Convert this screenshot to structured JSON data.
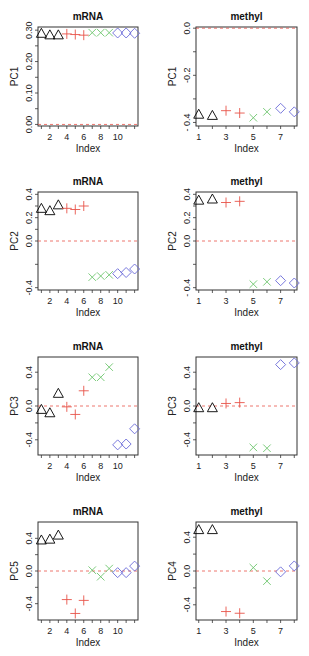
{
  "colors": {
    "group1": "#000000",
    "group2": "#e8534a",
    "group3": "#6cc56c",
    "group4": "#6a6ad8",
    "zero_line": "#e8534a",
    "axis": "#333333"
  },
  "chart_data": [
    {
      "type": "scatter",
      "title": "mRNA",
      "xlabel": "Index",
      "ylabel": "PC1",
      "x": [
        1,
        2,
        3,
        4,
        5,
        6,
        7,
        8,
        9,
        10,
        11,
        12
      ],
      "values": [
        0.29,
        0.285,
        0.285,
        0.288,
        0.286,
        0.284,
        0.292,
        0.292,
        0.292,
        0.291,
        0.291,
        0.29
      ],
      "groups": [
        1,
        1,
        1,
        2,
        2,
        2,
        3,
        3,
        3,
        4,
        4,
        4
      ],
      "xticks": [
        "2",
        "4",
        "6",
        "8",
        "10"
      ],
      "yticks": [
        "0.00",
        "0.10",
        "0.20",
        "0.30"
      ],
      "ylim": [
        -0.005,
        0.31
      ],
      "xlim": [
        0.6,
        12.4
      ],
      "hline": 0
    },
    {
      "type": "scatter",
      "title": "methyl",
      "xlabel": "Index",
      "ylabel": "PC1",
      "x": [
        1,
        2,
        3,
        4,
        5,
        6,
        7,
        8
      ],
      "values": [
        -0.365,
        -0.37,
        -0.35,
        -0.36,
        -0.38,
        -0.355,
        -0.34,
        -0.355
      ],
      "groups": [
        1,
        1,
        2,
        2,
        3,
        3,
        4,
        4
      ],
      "xticks": [
        "1",
        "3",
        "5",
        "7"
      ],
      "yticks": [
        "0.0",
        "-0.2",
        "- 0.4"
      ],
      "ylim": [
        -0.415,
        0.005
      ],
      "xlim": [
        0.8,
        8.2
      ],
      "hline": 0
    },
    {
      "type": "scatter",
      "title": "mRNA",
      "xlabel": "Index",
      "ylabel": "PC2",
      "x": [
        1,
        2,
        3,
        4,
        5,
        6,
        7,
        8,
        9,
        10,
        11,
        12
      ],
      "values": [
        0.28,
        0.26,
        0.31,
        0.28,
        0.27,
        0.3,
        -0.31,
        -0.3,
        -0.29,
        -0.28,
        -0.27,
        -0.24
      ],
      "groups": [
        1,
        1,
        1,
        2,
        2,
        2,
        3,
        3,
        3,
        4,
        4,
        4
      ],
      "xticks": [
        "2",
        "4",
        "6",
        "8",
        "10"
      ],
      "yticks": [
        "-0.4",
        "0.0",
        "0.2",
        "0.4"
      ],
      "ylim": [
        -0.42,
        0.42
      ],
      "xlim": [
        0.6,
        12.4
      ],
      "hline": 0
    },
    {
      "type": "scatter",
      "title": "methyl",
      "xlabel": "Index",
      "ylabel": "PC2",
      "x": [
        1,
        2,
        3,
        4,
        5,
        6,
        7,
        8
      ],
      "values": [
        0.35,
        0.36,
        0.33,
        0.34,
        -0.37,
        -0.35,
        -0.34,
        -0.36
      ],
      "groups": [
        1,
        1,
        2,
        2,
        3,
        3,
        4,
        4
      ],
      "xticks": [
        "1",
        "3",
        "5",
        "7"
      ],
      "yticks": [
        "- 0.4",
        "0.0",
        "0.2",
        "0.4"
      ],
      "ylim": [
        -0.42,
        0.42
      ],
      "xlim": [
        0.8,
        8.2
      ],
      "hline": 0
    },
    {
      "type": "scatter",
      "title": "mRNA",
      "xlabel": "Index",
      "ylabel": "PC3",
      "x": [
        1,
        2,
        3,
        4,
        5,
        6,
        7,
        8,
        9,
        10,
        11,
        12
      ],
      "values": [
        -0.04,
        -0.08,
        0.15,
        -0.01,
        -0.1,
        0.18,
        0.34,
        0.34,
        0.46,
        -0.46,
        -0.45,
        -0.27
      ],
      "groups": [
        1,
        1,
        1,
        2,
        2,
        2,
        3,
        3,
        3,
        4,
        4,
        4
      ],
      "xticks": [
        "2",
        "4",
        "6",
        "8",
        "10"
      ],
      "yticks": [
        "-0.4",
        "0.0",
        "0.4"
      ],
      "ylim": [
        -0.58,
        0.58
      ],
      "xlim": [
        0.6,
        12.4
      ],
      "hline": 0
    },
    {
      "type": "scatter",
      "title": "methyl",
      "xlabel": "Index",
      "ylabel": "PC3",
      "x": [
        1,
        2,
        3,
        4,
        5,
        6,
        7,
        8
      ],
      "values": [
        -0.02,
        -0.02,
        0.03,
        0.04,
        -0.49,
        -0.5,
        0.49,
        0.51
      ],
      "groups": [
        1,
        1,
        2,
        2,
        3,
        3,
        4,
        4
      ],
      "xticks": [
        "1",
        "3",
        "5",
        "7"
      ],
      "yticks": [
        "-0.4",
        "0.0",
        "0.4"
      ],
      "ylim": [
        -0.58,
        0.58
      ],
      "xlim": [
        0.8,
        8.2
      ],
      "hline": 0
    },
    {
      "type": "scatter",
      "title": "mRNA",
      "xlabel": "Index",
      "ylabel": "PC5",
      "x": [
        1,
        2,
        3,
        4,
        5,
        6,
        7,
        8,
        9,
        10,
        11,
        12
      ],
      "values": [
        0.38,
        0.39,
        0.44,
        -0.35,
        -0.52,
        -0.36,
        0.01,
        -0.07,
        0.03,
        -0.02,
        -0.02,
        0.06
      ],
      "groups": [
        1,
        1,
        1,
        2,
        2,
        2,
        3,
        3,
        3,
        4,
        4,
        4
      ],
      "xticks": [
        "2",
        "4",
        "6",
        "8",
        "10"
      ],
      "yticks": [
        "-0.4",
        "0.0",
        "0.4"
      ],
      "ylim": [
        -0.6,
        0.6
      ],
      "xlim": [
        0.6,
        12.4
      ],
      "hline": 0
    },
    {
      "type": "scatter",
      "title": "methyl",
      "xlabel": "Index",
      "ylabel": "PC4",
      "x": [
        1,
        2,
        3,
        4,
        5,
        6,
        7,
        8
      ],
      "values": [
        0.49,
        0.49,
        -0.48,
        -0.5,
        0.04,
        -0.12,
        -0.01,
        0.06
      ],
      "groups": [
        1,
        1,
        2,
        2,
        3,
        3,
        4,
        4
      ],
      "xticks": [
        "1",
        "3",
        "5",
        "7"
      ],
      "yticks": [
        "-0.4",
        "0.0",
        "0.4"
      ],
      "ylim": [
        -0.58,
        0.58
      ],
      "xlim": [
        0.8,
        8.2
      ],
      "hline": 0
    }
  ]
}
